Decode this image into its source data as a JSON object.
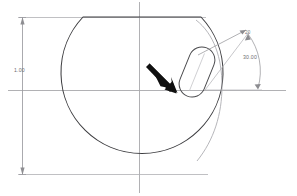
{
  "document": {
    "type": "cad-2d-sketch-view",
    "background_color": "#ffffff"
  },
  "colors": {
    "geometry_stroke": "#3a3a3c",
    "construction_stroke": "#9a9a9e",
    "centerline_stroke": "#a6a6aa",
    "dimension_stroke": "#9b9b9f",
    "dimension_text": "#6e6e70",
    "cursor_fill": "#101010"
  },
  "geometry": {
    "main_profile": {
      "name": "circle-with-top-chord",
      "center_x": 139,
      "center_y": 90,
      "radius": 81,
      "top_chord_y": 17,
      "top_chord_x_start": 83,
      "top_chord_x_end": 201
    },
    "slot_feature": {
      "name": "obround-slot",
      "center_x": 197,
      "center_y": 72,
      "length": 52,
      "width": 26,
      "rotation_deg": 22
    },
    "inner_arc": {
      "name": "right-inner-arc",
      "description": "construction arc inside right edge"
    }
  },
  "centerlines": {
    "horizontal": {
      "y": 90,
      "x_start": 8,
      "x_end": 286
    },
    "vertical": {
      "x": 139,
      "y_start": 2,
      "y_end": 192
    }
  },
  "dimensions": [
    {
      "id": "linear-vertical-left",
      "type": "linear",
      "label": "1.00",
      "orientation": "vertical",
      "line_x": 22,
      "y_top": 17,
      "y_bottom": 175,
      "text_x": 16,
      "text_y": 72,
      "extension_top_y": 17,
      "extension_bottom_y": 175,
      "extension_x_end": 205
    },
    {
      "id": "angular-upper",
      "type": "angular-leader",
      "label": "20",
      "text_x": 245,
      "text_y": 34
    },
    {
      "id": "angular-arc",
      "type": "angular",
      "label": "30.00",
      "text_x": 246,
      "text_y": 58,
      "vertex_x": 205,
      "vertex_y": 90,
      "arc_radius": 62
    }
  ],
  "cursor": {
    "name": "mouse-pointer-arrow",
    "tip_x": 176,
    "tip_y": 92,
    "tail_x": 150,
    "tail_y": 64,
    "angle_deg": 45
  }
}
